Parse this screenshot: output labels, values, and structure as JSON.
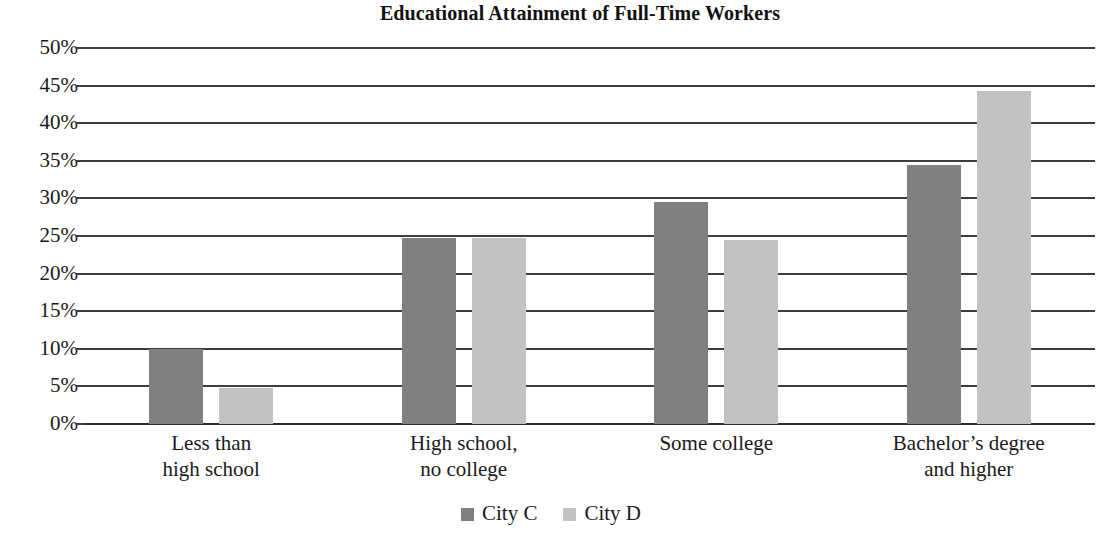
{
  "chart_data": {
    "type": "bar",
    "title": "Educational Attainment of Full-Time Workers",
    "xlabel": "",
    "ylabel": "",
    "ylim": [
      0,
      50
    ],
    "grid": true,
    "legend_position": "bottom",
    "value_suffix": "%",
    "categories": [
      "Less than high school",
      "High school, no college",
      "Some college",
      "Bachelor’s degree and higher"
    ],
    "category_lines": [
      [
        "Less than",
        "high school"
      ],
      [
        "High school,",
        "no college"
      ],
      [
        "Some college",
        ""
      ],
      [
        "Bachelor’s degree",
        "and higher"
      ]
    ],
    "series": [
      {
        "name": "City C",
        "color": "#808080",
        "values": [
          10.0,
          24.8,
          29.5,
          34.5
        ]
      },
      {
        "name": "City D",
        "color": "#c2c2c2",
        "values": [
          4.8,
          24.8,
          24.5,
          44.3
        ]
      }
    ],
    "y_ticks": [
      {
        "value": 50,
        "label": "50%"
      },
      {
        "value": 45,
        "label": "45%"
      },
      {
        "value": 40,
        "label": "40%"
      },
      {
        "value": 35,
        "label": "35%"
      },
      {
        "value": 30,
        "label": "30%"
      },
      {
        "value": 25,
        "label": "25%"
      },
      {
        "value": 20,
        "label": "20%"
      },
      {
        "value": 15,
        "label": "15%"
      },
      {
        "value": 10,
        "label": "10%"
      },
      {
        "value": 5,
        "label": "5%"
      },
      {
        "value": 0,
        "label": "0%"
      }
    ]
  },
  "legend": {
    "items": [
      {
        "label": "City C",
        "swatch": "series-c"
      },
      {
        "label": "City D",
        "swatch": "series-d"
      }
    ]
  }
}
